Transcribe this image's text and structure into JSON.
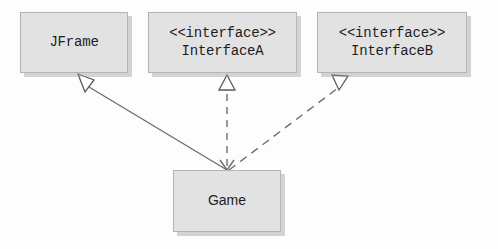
{
  "diagram": {
    "kind": "uml-class-diagram",
    "background_color": "#fdfdfd",
    "box_fill_color": "#e2e2e2",
    "box_border_color": "#b4b4b4",
    "line_color": "#6e6e6e",
    "text_color": "#1d1d1d",
    "classes": [
      {
        "id": "jframe",
        "name": "JFrame",
        "stereotype": "",
        "x": 20,
        "y": 12,
        "width": 108,
        "height": 61
      },
      {
        "id": "interface_a",
        "name": "InterfaceA",
        "stereotype": "<<interface>>",
        "x": 148,
        "y": 12,
        "width": 149,
        "height": 61
      },
      {
        "id": "interface_b",
        "name": "InterfaceB",
        "stereotype": "<<interface>>",
        "x": 317,
        "y": 12,
        "width": 150,
        "height": 61
      },
      {
        "id": "game",
        "name": "Game",
        "stereotype": "",
        "x": 173,
        "y": 170,
        "width": 108,
        "height": 62
      }
    ],
    "relationships": [
      {
        "id": "game-extends-jframe",
        "from": "game",
        "to": "jframe",
        "type": "generalization",
        "line_style": "solid",
        "arrowhead": "hollow-triangle",
        "label": ""
      },
      {
        "id": "game-implements-interfacea",
        "from": "game",
        "to": "interface_a",
        "type": "realization",
        "line_style": "dashed",
        "arrowhead": "hollow-triangle",
        "label": ""
      },
      {
        "id": "game-implements-interfaceb",
        "from": "game",
        "to": "interface_b",
        "type": "realization",
        "line_style": "dashed",
        "arrowhead": "hollow-triangle",
        "label": ""
      }
    ]
  }
}
